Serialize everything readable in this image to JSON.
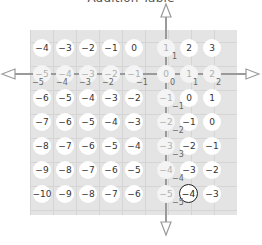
{
  "title": "Addition Table",
  "grid": {
    "rows": [
      [
        -4,
        -3,
        -2,
        -1,
        0,
        1,
        2,
        3
      ],
      [
        -5,
        -4,
        -3,
        -2,
        -1,
        0,
        1,
        2
      ],
      [
        -6,
        -5,
        -4,
        -3,
        -2,
        -1,
        0,
        1
      ],
      [
        -7,
        -6,
        -5,
        -4,
        -3,
        -2,
        -1,
        0
      ],
      [
        -8,
        -7,
        -6,
        -5,
        -4,
        -3,
        -2,
        -1
      ],
      [
        -9,
        -8,
        -7,
        -6,
        -5,
        -4,
        -3,
        -2
      ],
      [
        -10,
        -9,
        -8,
        -7,
        -6,
        -5,
        -4,
        -3
      ]
    ],
    "highlight_row_index": 1,
    "highlight_col_index": 5,
    "circled_cell": {
      "row": 6,
      "col": 6,
      "value": "-4"
    },
    "row_subscripts": [
      "-5",
      "-4",
      "-3",
      "-2",
      "-1",
      "0",
      "1",
      "2"
    ],
    "col_subscripts": [
      "1",
      "0",
      "-1",
      "-2",
      "-3",
      "-4",
      "-5"
    ]
  },
  "labels": {
    "r0": [
      "−4",
      "−3",
      "−2",
      "−1",
      "0",
      "1",
      "2",
      "3"
    ],
    "r1": [
      "−5",
      "−4",
      "−3",
      "−2",
      "−1",
      "0",
      "1",
      "2"
    ],
    "r2": [
      "−6",
      "−5",
      "−4",
      "−3",
      "−2",
      "−1",
      "0",
      "1"
    ],
    "r3": [
      "−7",
      "−6",
      "−5",
      "−4",
      "−3",
      "−2",
      "−1",
      "0"
    ],
    "r4": [
      "−8",
      "−7",
      "−6",
      "−5",
      "−4",
      "−3",
      "−2",
      "−1"
    ],
    "r5": [
      "−9",
      "−8",
      "−7",
      "−6",
      "−5",
      "−4",
      "−3",
      "−2"
    ],
    "r6": [
      "−10",
      "−9",
      "−8",
      "−7",
      "−6",
      "−5",
      "−4",
      "−3"
    ],
    "rsub": [
      "−5",
      "−4",
      "−3",
      "−2",
      "−1",
      "0",
      "1",
      "2"
    ],
    "csub": [
      "1",
      "0",
      "−1",
      "−2",
      "−3",
      "−4",
      "−5"
    ]
  },
  "colors": {
    "grid_bg": "#e4e4e4",
    "arrow": "#9a9a9a",
    "text": "#333333",
    "faded_text": "#b0b0b0"
  }
}
